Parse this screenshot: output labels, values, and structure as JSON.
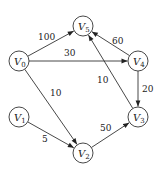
{
  "nodes": [
    {
      "id": "V0",
      "letter": "V",
      "sub": "0",
      "x": 19,
      "y": 61
    },
    {
      "id": "V1",
      "letter": "V",
      "sub": "1",
      "x": 19,
      "y": 117
    },
    {
      "id": "V2",
      "letter": "V",
      "sub": "2",
      "x": 83,
      "y": 153
    },
    {
      "id": "V3",
      "letter": "V",
      "sub": "3",
      "x": 138,
      "y": 117
    },
    {
      "id": "V4",
      "letter": "V",
      "sub": "4",
      "x": 138,
      "y": 61
    },
    {
      "id": "V5",
      "letter": "V",
      "sub": "5",
      "x": 83,
      "y": 26
    }
  ],
  "edges": [
    {
      "from": "V0",
      "to": "V5",
      "weight": "100",
      "lx": 38,
      "ly": 40
    },
    {
      "from": "V0",
      "to": "V4",
      "weight": "30",
      "lx": 64,
      "ly": 56
    },
    {
      "from": "V0",
      "to": "V2",
      "weight": "10",
      "lx": 50,
      "ly": 96
    },
    {
      "from": "V1",
      "to": "V2",
      "weight": "5",
      "lx": 42,
      "ly": 142
    },
    {
      "from": "V2",
      "to": "V3",
      "weight": "50",
      "lx": 100,
      "ly": 131
    },
    {
      "from": "V4",
      "to": "V5",
      "weight": "60",
      "lx": 112,
      "ly": 44
    },
    {
      "from": "V4",
      "to": "V3",
      "weight": "20",
      "lx": 142,
      "ly": 92
    },
    {
      "from": "V3",
      "to": "V5",
      "weight": "10",
      "lx": 97,
      "ly": 83
    }
  ]
}
